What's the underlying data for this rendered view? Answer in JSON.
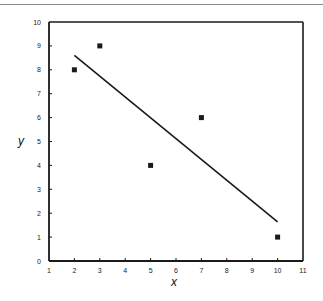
{
  "chart_data": {
    "type": "scatter",
    "title": "",
    "xlabel": "x",
    "ylabel": "y",
    "xlim": [
      1,
      11
    ],
    "ylim": [
      0,
      10
    ],
    "xticks": [
      1,
      2,
      3,
      4,
      5,
      6,
      7,
      8,
      9,
      10,
      11
    ],
    "yticks": [
      0,
      1,
      2,
      3,
      4,
      5,
      6,
      7,
      8,
      9,
      10
    ],
    "grid": false,
    "legend": null,
    "series": [
      {
        "name": "data",
        "type": "scatter",
        "marker": "square",
        "x": [
          2,
          3,
          5,
          7,
          10
        ],
        "y": [
          8,
          9,
          4,
          6,
          1
        ]
      },
      {
        "name": "least-squares fit",
        "type": "line",
        "x": [
          2,
          10
        ],
        "y": [
          8.6,
          1.64
        ]
      }
    ]
  },
  "colors": {
    "ink": "#1a1a1a",
    "background": "#ffffff"
  }
}
